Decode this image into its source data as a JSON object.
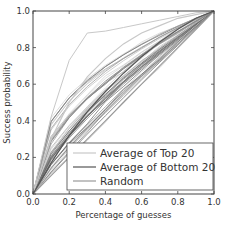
{
  "chart_data": {
    "type": "line",
    "title": "",
    "xlabel": "Percentage of guesses",
    "ylabel": "Success probability",
    "xlim": [
      0.0,
      1.0
    ],
    "ylim": [
      0.0,
      1.0
    ],
    "xticks": [
      "0.0",
      "0.2",
      "0.4",
      "0.6",
      "0.8",
      "1.0"
    ],
    "yticks": [
      "0.0",
      "0.2",
      "0.4",
      "0.6",
      "0.8",
      "1.0"
    ],
    "grid": false,
    "legend_position": "lower right",
    "legend": [
      {
        "label": "Average of Top 20",
        "color": "#c8c8c8"
      },
      {
        "label": "Average of Bottom 20",
        "color": "#555555"
      },
      {
        "label": "Random",
        "color": "#999999"
      }
    ],
    "x": [
      0.0,
      0.1,
      0.2,
      0.3,
      0.4,
      0.5,
      0.6,
      0.7,
      0.8,
      0.9,
      1.0
    ],
    "series": [
      {
        "name": "Random",
        "values": [
          0.0,
          0.1,
          0.2,
          0.3,
          0.4,
          0.5,
          0.6,
          0.7,
          0.8,
          0.9,
          1.0
        ]
      },
      {
        "name": "Highest individual curve",
        "values": [
          0.0,
          0.42,
          0.73,
          0.88,
          0.89,
          0.91,
          0.93,
          0.95,
          0.97,
          0.99,
          1.0
        ]
      },
      {
        "name": "Average of Top 20 (approx.)",
        "values": [
          0.0,
          0.3,
          0.5,
          0.64,
          0.74,
          0.82,
          0.88,
          0.92,
          0.96,
          0.98,
          1.0
        ]
      },
      {
        "name": "Average of Bottom 20 (approx.)",
        "values": [
          0.0,
          0.17,
          0.32,
          0.45,
          0.56,
          0.66,
          0.75,
          0.83,
          0.9,
          0.96,
          1.0
        ]
      }
    ],
    "curve_bundle": {
      "count": 45,
      "exponent_min": 0.38,
      "exponent_max": 0.95,
      "colors": [
        "#d0d0d0",
        "#bdbdbd",
        "#a8a8a8",
        "#929292",
        "#7a7a7a",
        "#666666"
      ]
    }
  },
  "legend": {
    "items": [
      {
        "label": "Average of Top 20"
      },
      {
        "label": "Average of Bottom 20"
      },
      {
        "label": "Random"
      }
    ]
  },
  "axes": {
    "xlabel": "Percentage of guesses",
    "ylabel": "Success probability"
  }
}
